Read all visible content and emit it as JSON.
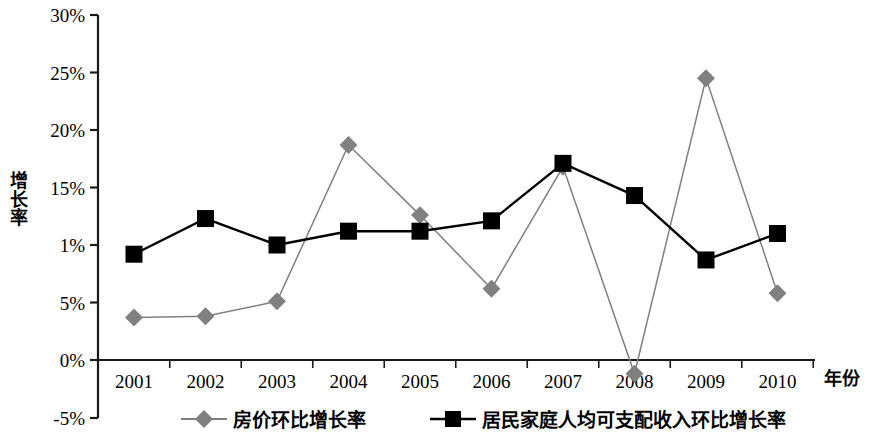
{
  "chart_data": {
    "type": "line",
    "title": "",
    "xlabel": "年份",
    "ylabel": "增长率",
    "categories": [
      "2001",
      "2002",
      "2003",
      "2004",
      "2005",
      "2006",
      "2007",
      "2008",
      "2009",
      "2010"
    ],
    "ylim": [
      -5,
      30
    ],
    "ytick_labels": [
      "30%",
      "25%",
      "20%",
      "15%",
      "1%",
      "5%",
      "0%",
      "-5%"
    ],
    "ytick_values": [
      30,
      25,
      20,
      15,
      10,
      5,
      0,
      -5
    ],
    "grid": false,
    "legend_position": "bottom",
    "series": [
      {
        "name": "房价环比增长率",
        "marker": "diamond",
        "color": "#808080",
        "values": [
          3.7,
          3.8,
          5.1,
          18.7,
          12.6,
          6.2,
          16.8,
          -1.2,
          24.5,
          5.8
        ]
      },
      {
        "name": "居民家庭人均可支配收入环比增长率",
        "marker": "square",
        "color": "#000000",
        "values": [
          9.2,
          12.3,
          10.0,
          11.2,
          11.2,
          12.1,
          17.1,
          14.3,
          8.7,
          11.0
        ]
      }
    ]
  },
  "axis": {
    "y_title_chars": [
      "增",
      "长",
      "率"
    ],
    "x_title": "年份"
  },
  "legend": {
    "items": [
      {
        "label": "房价环比增长率",
        "marker": "diamond-marker-icon",
        "color": "#808080"
      },
      {
        "label": "居民家庭人均可支配收入环比增长率",
        "marker": "square-marker-icon",
        "color": "#000000"
      }
    ]
  }
}
